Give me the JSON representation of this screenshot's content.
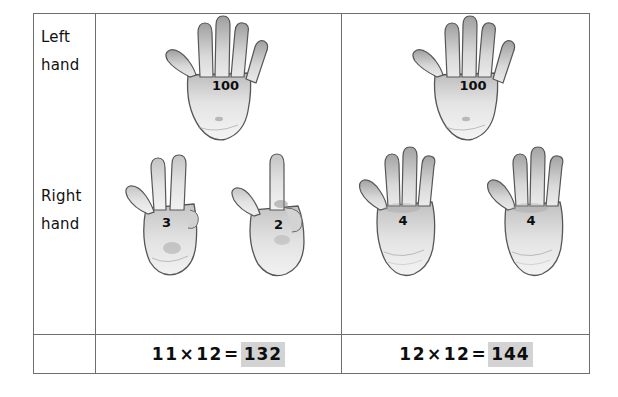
{
  "worksheet": {
    "title": "Finger multiplication for 11s and 12s",
    "row_labels": {
      "left_hand": {
        "line1": "Left",
        "line2": "hand"
      },
      "right_hand": {
        "line1": "Right",
        "line2": "hand"
      }
    },
    "columns": [
      {
        "id": "column-11x12",
        "left_hand": [
          {
            "label": "100",
            "fingers_up": 5
          }
        ],
        "right_hand": [
          {
            "label": "3",
            "fingers_up": 3
          },
          {
            "label": "2",
            "fingers_up": 2
          }
        ],
        "equation": {
          "factor_a": "11",
          "operator": "×",
          "factor_b": "12",
          "equals": "=",
          "product": "132",
          "full_text": "11 × 12 = 132"
        }
      },
      {
        "id": "column-12x12",
        "left_hand": [
          {
            "label": "100",
            "fingers_up": 5
          }
        ],
        "right_hand": [
          {
            "label": "4",
            "fingers_up": 4
          },
          {
            "label": "4",
            "fingers_up": 4
          }
        ],
        "equation": {
          "factor_a": "12",
          "operator": "×",
          "factor_b": "12",
          "equals": "=",
          "product": "144",
          "full_text": "12 × 12 = 144"
        }
      }
    ],
    "colors": {
      "border": "#6e6e6e",
      "highlight": "#d3d3d3",
      "text": "#0d0d0d",
      "background": "#ffffff",
      "hand_fill": "#e9e9e9",
      "hand_outline": "#4a4a4a"
    }
  }
}
